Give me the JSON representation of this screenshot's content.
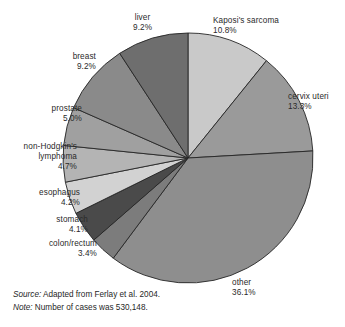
{
  "chart_data": {
    "type": "pie",
    "title": "",
    "subtitle": "",
    "xlabel": "",
    "ylabel": "",
    "legend_position": "outside-labels",
    "grid": false,
    "start_angle_deg": 0,
    "direction": "clockwise",
    "total_cases": "530,148",
    "categories": [
      "Kaposi's sarcoma",
      "cervix uteri",
      "other",
      "colon/rectum",
      "stomach",
      "esophagus",
      "non-Hodgkin's lymphoma",
      "prostate",
      "breast",
      "liver"
    ],
    "values": [
      10.8,
      13.3,
      36.1,
      3.4,
      4.1,
      4.2,
      4.7,
      5.0,
      9.2,
      9.2
    ],
    "units": "percent",
    "slices": [
      {
        "label": "Kaposi's sarcoma",
        "label_line1": "Kaposi's sarcoma",
        "label_line2": "",
        "percent": 10.8,
        "percent_text": "10.8%",
        "color": "#c9c9c9"
      },
      {
        "label": "cervix uteri",
        "label_line1": "cervix uteri",
        "label_line2": "",
        "percent": 13.3,
        "percent_text": "13.3%",
        "color": "#9a9a9a"
      },
      {
        "label": "other",
        "label_line1": "other",
        "label_line2": "",
        "percent": 36.1,
        "percent_text": "36.1%",
        "color": "#8e8e8e"
      },
      {
        "label": "colon/rectum",
        "label_line1": "colon/rectum",
        "label_line2": "",
        "percent": 3.4,
        "percent_text": "3.4%",
        "color": "#7c7c7c"
      },
      {
        "label": "stomach",
        "label_line1": "stomach",
        "label_line2": "",
        "percent": 4.1,
        "percent_text": "4.1%",
        "color": "#4a4a4a"
      },
      {
        "label": "esophagus",
        "label_line1": "esophagus",
        "label_line2": "",
        "percent": 4.2,
        "percent_text": "4.2%",
        "color": "#d2d2d2"
      },
      {
        "label": "non-Hodgkin's lymphoma",
        "label_line1": "non-Hodgkin's",
        "label_line2": "lymphoma",
        "percent": 4.7,
        "percent_text": "4.7%",
        "color": "#b4b4b4"
      },
      {
        "label": "prostate",
        "label_line1": "prostate",
        "label_line2": "",
        "percent": 5.0,
        "percent_text": "5.0%",
        "color": "#a0a0a0"
      },
      {
        "label": "breast",
        "label_line1": "breast",
        "label_line2": "",
        "percent": 9.2,
        "percent_text": "9.2%",
        "color": "#8a8a8a"
      },
      {
        "label": "liver",
        "label_line1": "liver",
        "label_line2": "",
        "percent": 9.2,
        "percent_text": "9.2%",
        "color": "#6e6e6e"
      }
    ],
    "geometry": {
      "cx": 188,
      "cy": 158,
      "r": 125
    },
    "stroke_color": "#262626"
  },
  "footer": {
    "source_key": "Source:",
    "source_text": "Adapted from Ferlay et al. 2004.",
    "note_key": "Note:",
    "note_text": "Number of cases was 530,148."
  }
}
